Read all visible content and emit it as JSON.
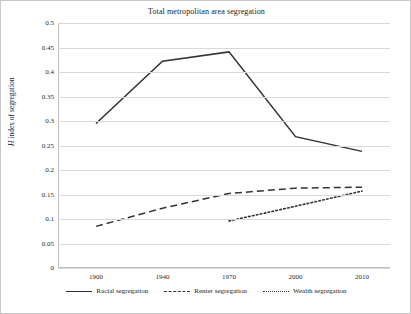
{
  "chart_data": {
    "type": "line",
    "title": "Total metropolitan area segregation",
    "xlabel": "",
    "ylabel": "H index of segregation",
    "categories": [
      "1900",
      "1940",
      "1970",
      "2000",
      "2010"
    ],
    "x": [
      1900,
      1940,
      1970,
      2000,
      2010
    ],
    "ylim": [
      0,
      0.5
    ],
    "yticks": [
      "0",
      "0.05",
      "0.1",
      "0.15",
      "0.2",
      "0.25",
      "0.3",
      "0.35",
      "0.4",
      "0.45",
      "0.5"
    ],
    "ytick_values": [
      0,
      0.05,
      0.1,
      0.15,
      0.2,
      0.25,
      0.3,
      0.35,
      0.4,
      0.45,
      0.5
    ],
    "grid": "horizontal",
    "legend_position": "bottom",
    "series": [
      {
        "name": "Racial segregation",
        "style": "solid",
        "color": "#333333",
        "x": [
          1900,
          1940,
          1970,
          2000,
          2010
        ],
        "values": [
          0.295,
          0.422,
          0.441,
          0.268,
          0.238
        ]
      },
      {
        "name": "Renter segregation",
        "style": "dashed",
        "color": "#333333",
        "x": [
          1900,
          1940,
          1970,
          2000,
          2010
        ],
        "values": [
          0.085,
          0.122,
          0.152,
          0.163,
          0.165
        ]
      },
      {
        "name": "Wealth segregation",
        "style": "dotted",
        "color": "#333333",
        "x": [
          1970,
          2000,
          2010
        ],
        "values": [
          0.096,
          0.126,
          0.157
        ]
      }
    ]
  },
  "legend": {
    "items": [
      {
        "label": "Racial segregation",
        "style": "solid"
      },
      {
        "label": "Renter segregation",
        "style": "dashed"
      },
      {
        "label": "Wealth segregation",
        "style": "dotted"
      }
    ]
  },
  "axis": {
    "y_label_prefix": "H",
    "y_label_rest": " index of segregation"
  }
}
